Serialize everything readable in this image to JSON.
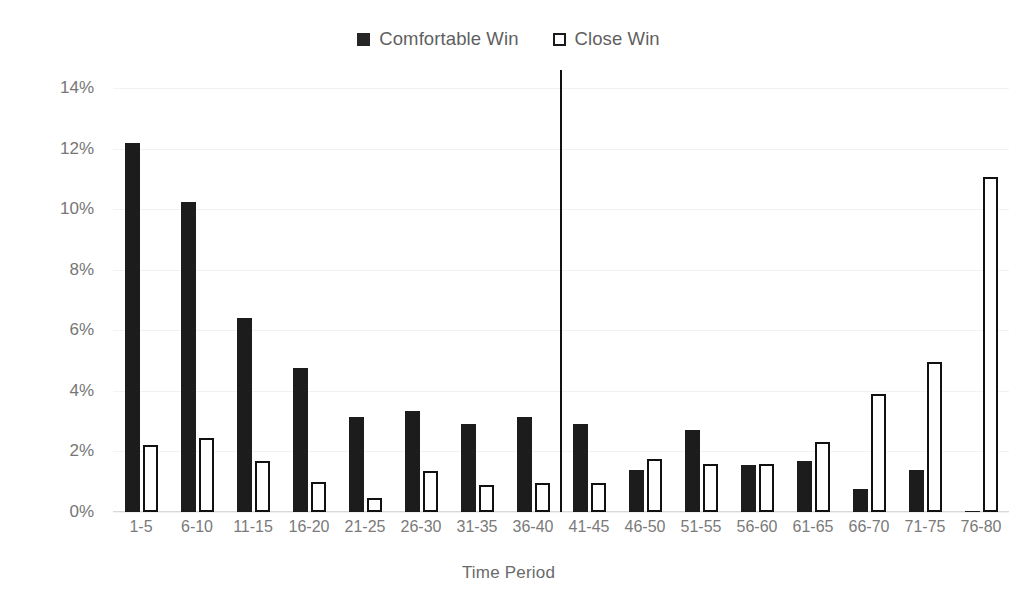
{
  "chart_data": {
    "type": "bar",
    "title": "",
    "xlabel": "Time Period",
    "ylabel": "Peercentage of Matches",
    "categories": [
      "1-5",
      "6-10",
      "11-15",
      "16-20",
      "21-25",
      "26-30",
      "31-35",
      "36-40",
      "41-45",
      "46-50",
      "51-55",
      "56-60",
      "61-65",
      "66-70",
      "71-75",
      "76-80"
    ],
    "series": [
      {
        "name": "Comfortable Win",
        "color": "#1c1c1c",
        "style": "filled",
        "values": [
          12.2,
          10.25,
          6.4,
          4.75,
          3.15,
          3.35,
          2.9,
          3.15,
          2.9,
          1.4,
          2.7,
          1.55,
          1.7,
          0.75,
          1.4,
          0.05
        ]
      },
      {
        "name": "Close Win",
        "color": "#ffffff",
        "style": "outline",
        "values": [
          2.2,
          2.45,
          1.7,
          1.0,
          0.45,
          1.35,
          0.9,
          0.95,
          0.95,
          1.75,
          1.6,
          1.6,
          2.3,
          3.9,
          4.95,
          11.05
        ]
      }
    ],
    "ylim": [
      0,
      14
    ],
    "ytick_values": [
      0,
      2,
      4,
      6,
      8,
      10,
      12,
      14
    ],
    "ytick_labels": [
      "0%",
      "2%",
      "4%",
      "6%",
      "8%",
      "10%",
      "12%",
      "14%"
    ],
    "grid": true,
    "legend_position": "top",
    "annotations": [
      {
        "type": "vertical-divider",
        "after_category": "36-40",
        "color": "#111111"
      }
    ]
  },
  "legend": {
    "items": [
      {
        "label": "Comfortable Win",
        "swatch": "filled-square"
      },
      {
        "label": "Close Win",
        "swatch": "outline-square"
      }
    ]
  },
  "axes": {
    "y_title": "Peercentage of Matches",
    "x_title": "Time Period"
  }
}
